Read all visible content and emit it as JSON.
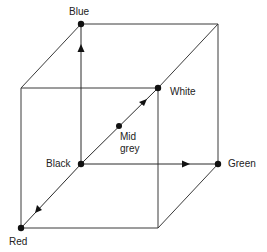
{
  "diagram": {
    "vertices": [
      {
        "id": "blue",
        "label": "Blue"
      },
      {
        "id": "white",
        "label": "White"
      },
      {
        "id": "black",
        "label": "Black"
      },
      {
        "id": "green",
        "label": "Green"
      },
      {
        "id": "red",
        "label": "Red"
      },
      {
        "id": "mid_grey",
        "label_line1": "Mid",
        "label_line2": "grey"
      }
    ],
    "axes": [
      {
        "from": "Black",
        "to": "Blue"
      },
      {
        "from": "Black",
        "to": "Green"
      },
      {
        "from": "Black",
        "to": "Red"
      },
      {
        "from": "Black",
        "to": "White"
      }
    ],
    "colors": {
      "line": "#3a3a3a",
      "dot": "#111111",
      "text": "#222222",
      "background": "#ffffff"
    }
  }
}
